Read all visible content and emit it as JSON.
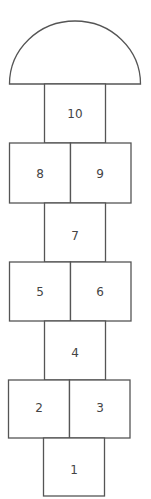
{
  "diagram": {
    "type": "hopscotch",
    "stroke_color": "#555555",
    "text_color": "#444444",
    "head": {
      "shape": "semicircle"
    },
    "squares": [
      {
        "label": "10"
      },
      {
        "label": "8"
      },
      {
        "label": "9"
      },
      {
        "label": "7"
      },
      {
        "label": "5"
      },
      {
        "label": "6"
      },
      {
        "label": "4"
      },
      {
        "label": "2"
      },
      {
        "label": "3"
      },
      {
        "label": "1"
      }
    ]
  }
}
